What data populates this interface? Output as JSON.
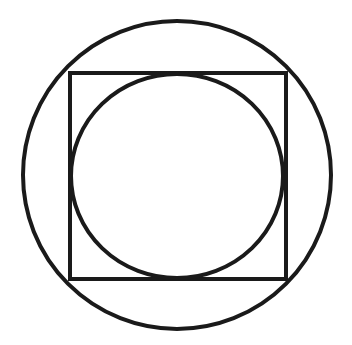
{
  "diagram": {
    "title": "Circle inscribed in square inscribed in circle",
    "stroke_color": "#1a1a1a",
    "background": "#ffffff",
    "stroke_width": 4,
    "outer_circle": {
      "cx": 177,
      "cy": 175,
      "r": 154
    },
    "square": {
      "x": 70,
      "y": 73,
      "width": 216,
      "height": 206
    },
    "inner_circle": {
      "cx": 177,
      "cy": 176,
      "rx": 106,
      "ry": 102
    }
  }
}
